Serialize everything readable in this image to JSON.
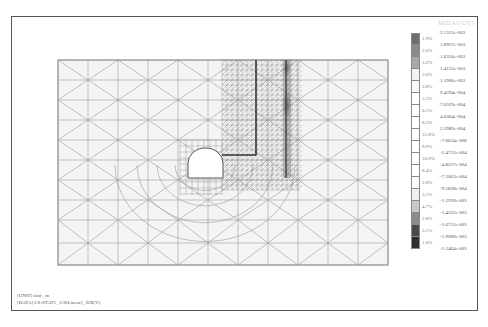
{
  "figure": {
    "type": "finite-element contour plot",
    "legend": {
      "title": "",
      "values": [
        "2.1312e-003",
        "1.8937e-003",
        "1.6350e-003",
        "1.4152e-003",
        "1.1906e-003",
        "9.4294e-004",
        "7.0329e-004",
        "4.6364e-004",
        "2.2989e-004",
        "-7.6634e-006",
        "-2.4722e-004",
        "-4.8257e-004",
        "-7.2063e-004",
        "-9.5828e-004",
        "-1.1959e-003",
        "-1.4322e-003",
        "-1.6712e-003",
        "-1.9089e-003",
        "-2.1464e-003"
      ],
      "percentages": [
        "1.9%",
        "2.0%",
        "3.2%",
        "3.0%",
        "3.8%",
        "5.5%",
        "6.1%",
        "8.2%",
        "12.8%",
        "9.9%",
        "10.9%",
        "8.4%",
        "2.8%",
        "3.1%",
        "4.7%",
        "2.8%",
        "3.1%",
        "1.0%"
      ],
      "colors": [
        "#6e6e6e",
        "#8a8a8a",
        "#a8a8a8",
        "#f4f4f4",
        "#fafafa",
        "#ffffff",
        "#ffffff",
        "#ffffff",
        "#ffffff",
        "#ffffff",
        "#ffffff",
        "#ffffff",
        "#fafafa",
        "#f0f0f0",
        "#c8c8c8",
        "#8c8c8c",
        "#4a4a4a",
        "#2e2e2e"
      ]
    },
    "footer": {
      "line1": "[UNIT] tonf , m",
      "line2": "[DATA] CS:STAT1 , CS[Linear] , DX(V)"
    }
  }
}
